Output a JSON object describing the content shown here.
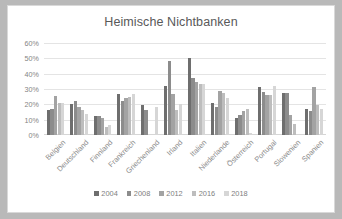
{
  "chart_data": {
    "type": "bar",
    "title": "Heimische Nichtbanken",
    "xlabel": "",
    "ylabel": "",
    "ylim": [
      0,
      60
    ],
    "ytick_labels": [
      "60%",
      "50%",
      "40%",
      "30%",
      "20%",
      "10%",
      "0%"
    ],
    "ytick_values": [
      60,
      50,
      40,
      30,
      20,
      10,
      0
    ],
    "grid": true,
    "legend_position": "bottom",
    "categories": [
      "Belgien",
      "Deutschland",
      "Finnland",
      "Frankreich",
      "Griechenland",
      "Irland",
      "Italien",
      "Niederlande",
      "Österreich",
      "Portugal",
      "Slowenien",
      "Spanien"
    ],
    "series": [
      {
        "name": "2004",
        "color": "#6e6e6e",
        "values": [
          16,
          20,
          12.5,
          27,
          19.5,
          32,
          50,
          21,
          11,
          31.5,
          27.5,
          17
        ]
      },
      {
        "name": "2008",
        "color": "#8c8c8c",
        "values": [
          17,
          22,
          12.5,
          22,
          16,
          48,
          37,
          18,
          13,
          28,
          27.5,
          15.5
        ]
      },
      {
        "name": "2012",
        "color": "#a3a3a3",
        "values": [
          25.5,
          18,
          11,
          24,
          null,
          27,
          34.5,
          28.5,
          15.5,
          26,
          13,
          31
        ]
      },
      {
        "name": "2016",
        "color": "#bdbdbd",
        "values": [
          21,
          16.5,
          5.5,
          25,
          null,
          16,
          33,
          27.5,
          17,
          26,
          7.5,
          19.5
        ]
      },
      {
        "name": "2018",
        "color": "#d6d6d6",
        "values": [
          21,
          14,
          6.5,
          27,
          18,
          20,
          33,
          24,
          1,
          32,
          null,
          17
        ]
      }
    ]
  }
}
